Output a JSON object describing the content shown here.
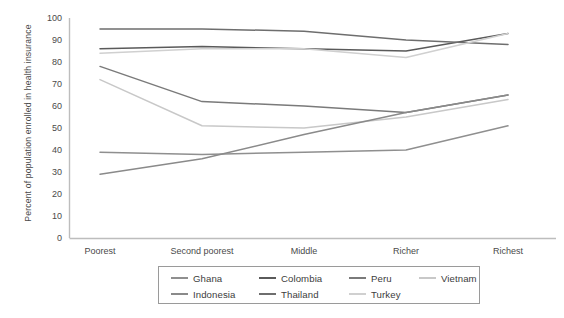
{
  "chart_data": {
    "type": "line",
    "title": "",
    "xlabel": "",
    "ylabel": "Percent of population enrolled in health insurance",
    "categories": [
      "Poorest",
      "Second poorest",
      "Middle",
      "Richer",
      "Richest"
    ],
    "ylim": [
      0,
      100
    ],
    "ytick_step": 10,
    "yticks": [
      0,
      10,
      20,
      30,
      40,
      50,
      60,
      70,
      80,
      90,
      100
    ],
    "grid": false,
    "legend_position": "bottom",
    "series": [
      {
        "name": "Ghana",
        "values": [
          39,
          38,
          39,
          40,
          51
        ],
        "color": "#8f8f8f"
      },
      {
        "name": "Colombia",
        "values": [
          86,
          87,
          86,
          85,
          93
        ],
        "color": "#5a5a5a"
      },
      {
        "name": "Peru",
        "values": [
          78,
          62,
          60,
          57,
          65
        ],
        "color": "#7a7a7a"
      },
      {
        "name": "Vietnam",
        "values": [
          72,
          51,
          50,
          55,
          63
        ],
        "color": "#c8c8c8"
      },
      {
        "name": "Indonesia",
        "values": [
          29,
          36,
          47,
          57,
          65
        ],
        "color": "#8a8a8a"
      },
      {
        "name": "Thailand",
        "values": [
          95,
          95,
          94,
          90,
          88
        ],
        "color": "#6e6e6e"
      },
      {
        "name": "Turkey",
        "values": [
          84,
          86,
          86,
          82,
          93
        ],
        "color": "#d0d0d0"
      }
    ]
  },
  "legend": {
    "rows": [
      [
        "Ghana",
        "Colombia",
        "Peru",
        "Vietnam"
      ],
      [
        "Indonesia",
        "Thailand",
        "Turkey"
      ]
    ]
  },
  "axis": {
    "y_title": "Percent of population enrolled in health insurance",
    "y_labels": [
      "100",
      "90",
      "80",
      "70",
      "60",
      "50",
      "40",
      "30",
      "20",
      "10",
      "0"
    ],
    "x_labels": [
      "Poorest",
      "Second poorest",
      "Middle",
      "Richer",
      "Richest"
    ]
  },
  "colors": {
    "axis": "#bdbdbd",
    "text": "#4a4a4a",
    "legend_border": "#9a9a9a"
  }
}
